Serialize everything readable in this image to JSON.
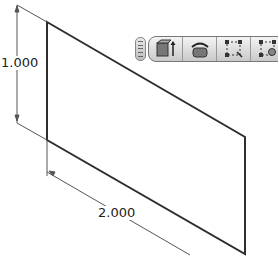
{
  "diagram": {
    "shape": "parallelogram-sketch",
    "stroke_color": "#333333",
    "dimensions": [
      {
        "label": "1.000",
        "orientation": "vertical"
      },
      {
        "label": "2.000",
        "orientation": "diagonal"
      }
    ]
  },
  "toolbar": {
    "buttons": [
      {
        "icon": "extrude-icon"
      },
      {
        "icon": "revolve-icon"
      },
      {
        "icon": "sketch-rectangle-icon"
      },
      {
        "icon": "sketch-point-icon"
      }
    ]
  }
}
